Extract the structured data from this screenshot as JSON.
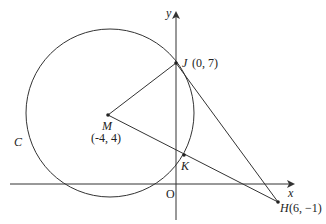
{
  "diagram": {
    "axes": {
      "x_label": "x",
      "y_label": "y",
      "origin_label": "O"
    },
    "circle": {
      "label": "C",
      "center_label": "M",
      "center_coords": "(-4, 4)"
    },
    "points": {
      "J": {
        "name": "J",
        "coords": "(0, 7)"
      },
      "K": {
        "name": "K"
      },
      "H": {
        "name": "H",
        "coords": "(6, −1)"
      }
    },
    "segments": [
      "MJ",
      "MH",
      "JH"
    ],
    "colors": {
      "stroke": "#333333",
      "background": "#ffffff"
    }
  }
}
